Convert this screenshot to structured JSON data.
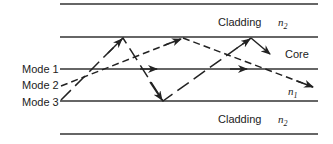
{
  "diagram": {
    "labels": {
      "cladding_top": "Cladding",
      "n2_top": "n",
      "n2_top_sub": "2",
      "core": "Core",
      "n1": "n",
      "n1_sub": "1",
      "cladding_bottom": "Cladding",
      "n2_bottom": "n",
      "n2_bottom_sub": "2"
    },
    "modes": [
      {
        "label": "Mode 1",
        "style": "solid"
      },
      {
        "label": "Mode 2",
        "style": "dashed"
      },
      {
        "label": "Mode 3",
        "style": "long-dash zigzag"
      }
    ],
    "colors": {
      "line": "#333333",
      "background": "#ffffff"
    }
  }
}
